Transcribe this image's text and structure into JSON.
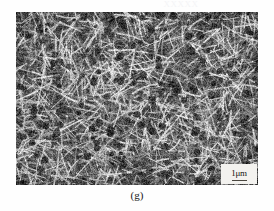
{
  "figure": {
    "type": "sem-micrograph",
    "caption": "(g)",
    "ghost_artifact_text": "XXXXX",
    "background_color": "#fefefe"
  },
  "micrograph": {
    "name": "sem-nanowire-network",
    "description": "Dense randomly oriented entangled nanowire / nanorod network",
    "alt": "Scanning electron micrograph of a dense mat of randomly oriented nanowires",
    "frame": {
      "x": 16,
      "y": 12,
      "width": 242,
      "height": 173
    },
    "tone": {
      "base_gray": "#6a6a6a",
      "dark_gray": "#1e1e1e",
      "light_gray": "#d8d8d8",
      "highlight": "#f0f0f0"
    },
    "texture": {
      "wire_count": 2600,
      "wire_min_length": 6,
      "wire_max_length": 34,
      "wire_min_width": 0.7,
      "wire_max_width": 2.2,
      "noise_amount": 0.26,
      "seed": 20240917
    }
  },
  "scale_bar": {
    "label": "1μm",
    "value": 1,
    "unit": "μm",
    "bar_length_px": 15,
    "box_background": "#f3f2ef",
    "text_color": "#15130f"
  }
}
